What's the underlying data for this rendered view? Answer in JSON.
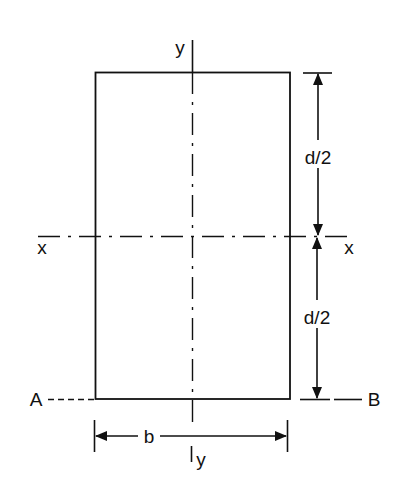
{
  "diagram": {
    "type": "rectangular cross-section with centroidal axes",
    "colors": {
      "line": "#111111",
      "background": "#ffffff"
    },
    "section": {
      "shape": "rectangle",
      "width_label": "b",
      "depth_label": "d"
    },
    "axes": {
      "x_axis": {
        "left_label": "x",
        "right_label": "x",
        "style": "dash-dot centerline"
      },
      "y_axis": {
        "top_label": "y",
        "bottom_label": "y",
        "style": "dash-dot centerline"
      }
    },
    "dimensions": {
      "upper_half": "d/2",
      "lower_half": "d/2",
      "width": "b"
    },
    "reference_line": {
      "left_label": "A",
      "right_label": "B",
      "style": "dashed, along base"
    }
  }
}
